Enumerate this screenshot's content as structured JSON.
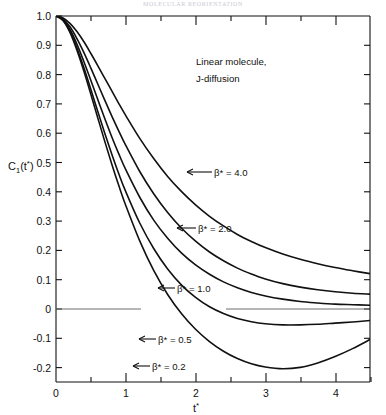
{
  "header": {
    "running_title": "MOLECULAR REORIENTATION"
  },
  "axes": {
    "ylabel_main": "C",
    "ylabel_sub": "1",
    "ylabel_arg_open": "(t",
    "ylabel_star": "*",
    "ylabel_close": ")",
    "xlabel_main": "t",
    "xlabel_star": "*",
    "y_ticklabels": [
      "1.0",
      "0.9",
      "0.8",
      "0.7",
      "0.6",
      "0.5",
      "0.4",
      "0.3",
      "0.2",
      "0.1",
      "0",
      "-0.1",
      "-0.2"
    ],
    "x_ticklabels": [
      "0",
      "1",
      "2",
      "3",
      "4"
    ],
    "xlim": [
      0,
      4.5
    ],
    "ylim": [
      -0.25,
      1.0
    ],
    "x_major": [
      0,
      1,
      2,
      3,
      4
    ],
    "x_minor": [
      0.5,
      1.5,
      2.5,
      3.5
    ],
    "y_major": [
      1.0,
      0.9,
      0.8,
      0.7,
      0.6,
      0.5,
      0.4,
      0.3,
      0.2,
      0.1,
      0.0,
      -0.1,
      -0.2
    ]
  },
  "annotation": {
    "line1": "Linear molecule,",
    "line2": "J-diffusion"
  },
  "colors": {
    "ink": "#111111",
    "background": "#ffffff",
    "zero_line": "#6d6d6d"
  },
  "chart_data": {
    "type": "line",
    "title": "",
    "subtitle": "Linear molecule, J-diffusion",
    "xlabel": "t*",
    "ylabel": "C1(t*)",
    "xlim": [
      0,
      4.5
    ],
    "ylim": [
      -0.25,
      1.0
    ],
    "grid": false,
    "legend": "inline-annotations",
    "annotations": [
      "Linear molecule,",
      "J-diffusion"
    ],
    "x": [
      0,
      0.1,
      0.2,
      0.3,
      0.4,
      0.5,
      0.6,
      0.7,
      0.8,
      0.9,
      1.0,
      1.2,
      1.4,
      1.6,
      1.8,
      2.0,
      2.2,
      2.4,
      2.6,
      2.8,
      3.0,
      3.25,
      3.5,
      3.75,
      4.0,
      4.25,
      4.5
    ],
    "series": [
      {
        "name": "beta* = 4.0",
        "label": "β* = 4.0",
        "values": [
          1.0,
          0.993,
          0.975,
          0.947,
          0.912,
          0.872,
          0.83,
          0.787,
          0.744,
          0.701,
          0.66,
          0.582,
          0.513,
          0.452,
          0.4,
          0.355,
          0.316,
          0.283,
          0.254,
          0.23,
          0.209,
          0.187,
          0.169,
          0.154,
          0.141,
          0.13,
          0.12
        ]
      },
      {
        "name": "beta* = 2.0",
        "label": "β* = 2.0",
        "values": [
          1.0,
          0.99,
          0.963,
          0.923,
          0.875,
          0.822,
          0.767,
          0.712,
          0.658,
          0.607,
          0.558,
          0.469,
          0.393,
          0.329,
          0.275,
          0.231,
          0.194,
          0.164,
          0.139,
          0.119,
          0.102,
          0.086,
          0.074,
          0.065,
          0.058,
          0.053,
          0.05
        ]
      },
      {
        "name": "beta* = 1.0",
        "label": "β* = 1.0",
        "values": [
          1.0,
          0.988,
          0.954,
          0.904,
          0.844,
          0.78,
          0.714,
          0.649,
          0.587,
          0.529,
          0.475,
          0.381,
          0.303,
          0.241,
          0.19,
          0.15,
          0.118,
          0.092,
          0.072,
          0.056,
          0.044,
          0.033,
          0.025,
          0.02,
          0.016,
          0.014,
          0.012
        ]
      },
      {
        "name": "beta* = 0.5",
        "label": "β* = 0.5",
        "values": [
          1.0,
          0.986,
          0.948,
          0.891,
          0.823,
          0.749,
          0.673,
          0.599,
          0.528,
          0.461,
          0.4,
          0.293,
          0.206,
          0.136,
          0.081,
          0.039,
          0.007,
          -0.016,
          -0.033,
          -0.044,
          -0.051,
          -0.055,
          -0.055,
          -0.053,
          -0.049,
          -0.045,
          -0.04
        ]
      },
      {
        "name": "beta* = 0.2",
        "label": "β* = 0.2",
        "values": [
          1.0,
          0.985,
          0.944,
          0.883,
          0.811,
          0.732,
          0.651,
          0.571,
          0.494,
          0.421,
          0.353,
          0.232,
          0.131,
          0.049,
          -0.017,
          -0.07,
          -0.112,
          -0.145,
          -0.17,
          -0.188,
          -0.199,
          -0.205,
          -0.2,
          -0.185,
          -0.163,
          -0.136,
          -0.105
        ]
      }
    ]
  }
}
